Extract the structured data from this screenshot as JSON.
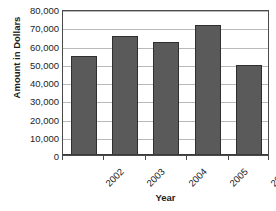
{
  "chart_data": {
    "type": "bar",
    "title": "Annual Donations",
    "categories": [
      "2002",
      "2003",
      "2004",
      "2005",
      "2006"
    ],
    "values": [
      54000,
      65000,
      62000,
      71000,
      49500
    ],
    "xlabel": "Year",
    "ylabel": "Amount in Dollars",
    "ylim": [
      0,
      80000
    ],
    "ytick_step": 10000,
    "ytick_labels": [
      "80,000",
      "70,000",
      "60,000",
      "50,000",
      "40,000",
      "30,000",
      "20,000",
      "10,000",
      "0"
    ],
    "ytick_values": [
      80000,
      70000,
      60000,
      50000,
      40000,
      30000,
      20000,
      10000,
      0
    ],
    "grid": true,
    "legend": false,
    "series": [
      {
        "name": "Donations",
        "values": [
          54000,
          65000,
          62000,
          71000,
          49500
        ]
      }
    ]
  },
  "style": {
    "bar_fill": "#5a5a5a",
    "bar_edge": "#2f2f2f",
    "gridline_color": "#b9b9b9",
    "axis_color": "#4a4a4a",
    "background": "#ffffff",
    "text_color": "#1d1d1d"
  }
}
